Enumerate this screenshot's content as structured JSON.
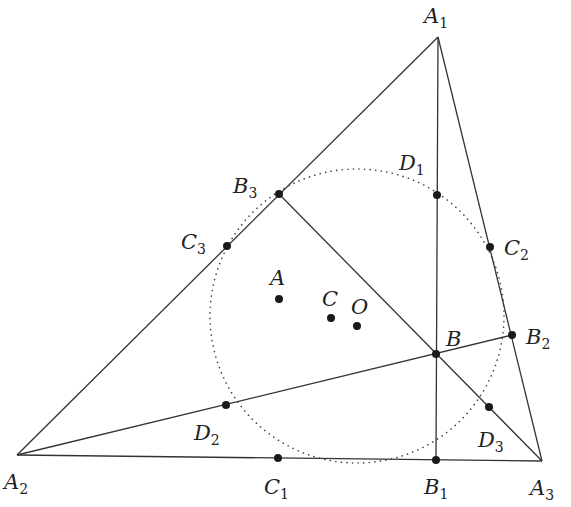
{
  "diagram": {
    "type": "triangle-geometry",
    "colors": {
      "line": "#333333",
      "point": "#1a1a1a",
      "text": "#222222",
      "background": "#ffffff"
    },
    "circle": {
      "name": "dotted-circle",
      "cx": 357,
      "cy": 316,
      "r": 147,
      "style": "dotted"
    },
    "vertices": {
      "A1": {
        "x": 438,
        "y": 37
      },
      "A2": {
        "x": 17,
        "y": 455
      },
      "A3": {
        "x": 542,
        "y": 461
      }
    },
    "points": [
      {
        "id": "B",
        "main": "B",
        "sub": "",
        "x": 436,
        "y": 354,
        "lx": 446,
        "ly": 346
      },
      {
        "id": "B1",
        "main": "B",
        "sub": "1",
        "x": 436,
        "y": 460,
        "lx": 424,
        "ly": 494
      },
      {
        "id": "B2",
        "main": "B",
        "sub": "2",
        "x": 512,
        "y": 335,
        "lx": 526,
        "ly": 344
      },
      {
        "id": "B3",
        "main": "B",
        "sub": "3",
        "x": 279,
        "y": 194,
        "lx": 233,
        "ly": 193
      },
      {
        "id": "C1",
        "main": "C",
        "sub": "1",
        "x": 278,
        "y": 458,
        "lx": 264,
        "ly": 494
      },
      {
        "id": "C2",
        "main": "C",
        "sub": "2",
        "x": 490,
        "y": 247,
        "lx": 504,
        "ly": 255
      },
      {
        "id": "C3",
        "main": "C",
        "sub": "3",
        "x": 227,
        "y": 246,
        "lx": 181,
        "ly": 249
      },
      {
        "id": "D1",
        "main": "D",
        "sub": "1",
        "x": 437,
        "y": 195,
        "lx": 399,
        "ly": 170
      },
      {
        "id": "D2",
        "main": "D",
        "sub": "2",
        "x": 226,
        "y": 405,
        "lx": 194,
        "ly": 440
      },
      {
        "id": "D3",
        "main": "D",
        "sub": "3",
        "x": 489,
        "y": 407,
        "lx": 478,
        "ly": 447
      },
      {
        "id": "A",
        "main": "A",
        "sub": "",
        "x": 279,
        "y": 299,
        "lx": 270,
        "ly": 285
      },
      {
        "id": "C",
        "main": "C",
        "sub": "",
        "x": 331,
        "y": 318,
        "lx": 322,
        "ly": 306
      },
      {
        "id": "O",
        "main": "O",
        "sub": "",
        "x": 357,
        "y": 326,
        "lx": 351,
        "ly": 314
      }
    ],
    "vertex_labels": [
      {
        "id": "A1",
        "main": "A",
        "sub": "1",
        "lx": 424,
        "ly": 23
      },
      {
        "id": "A2",
        "main": "A",
        "sub": "2",
        "lx": 4,
        "ly": 489
      },
      {
        "id": "A3",
        "main": "A",
        "sub": "3",
        "lx": 530,
        "ly": 495
      }
    ],
    "segments": [
      {
        "from": "A1",
        "to": "A2"
      },
      {
        "from": "A2",
        "to": "A3"
      },
      {
        "from": "A3",
        "to": "A1"
      },
      {
        "from": "A1",
        "to": "B1"
      },
      {
        "from": "A2",
        "to": "B2"
      },
      {
        "from": "A3",
        "to": "B3"
      }
    ]
  }
}
